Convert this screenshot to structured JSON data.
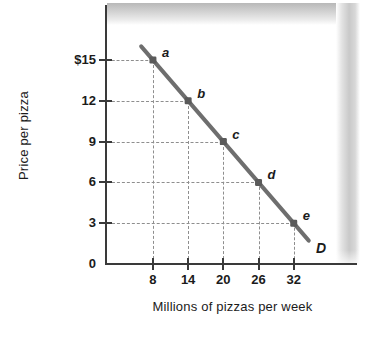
{
  "chart_data": {
    "type": "line",
    "title": "",
    "xlabel": "Millions of pizzas per week",
    "ylabel": "Price per pizza",
    "xlim": [
      0,
      38
    ],
    "ylim": [
      0,
      18
    ],
    "grid": "dashed-guides-to-points",
    "legend": "inline-curve-label",
    "curve_label": "D",
    "x_ticks": [
      {
        "value": 8,
        "label": "8"
      },
      {
        "value": 14,
        "label": "14"
      },
      {
        "value": 20,
        "label": "20"
      },
      {
        "value": 26,
        "label": "26"
      },
      {
        "value": 32,
        "label": "32"
      }
    ],
    "y_ticks": [
      {
        "value": 15,
        "label": "$15"
      },
      {
        "value": 12,
        "label": "12"
      },
      {
        "value": 9,
        "label": "9"
      },
      {
        "value": 6,
        "label": "6"
      },
      {
        "value": 3,
        "label": "3"
      },
      {
        "value": 0,
        "label": "0"
      }
    ],
    "series": [
      {
        "name": "D",
        "points": [
          {
            "label": "a",
            "x": 8,
            "y": 15
          },
          {
            "label": "b",
            "x": 14,
            "y": 12
          },
          {
            "label": "c",
            "x": 20,
            "y": 9
          },
          {
            "label": "d",
            "x": 26,
            "y": 6
          },
          {
            "label": "e",
            "x": 32,
            "y": 3
          }
        ]
      }
    ],
    "colors": {
      "line": "#6e6e6e",
      "marker": "#5a5a5a",
      "axis": "#3a3a3a",
      "guide": "#8e8e8e",
      "text": "#1b1b1b",
      "background": "#ffffff"
    }
  }
}
